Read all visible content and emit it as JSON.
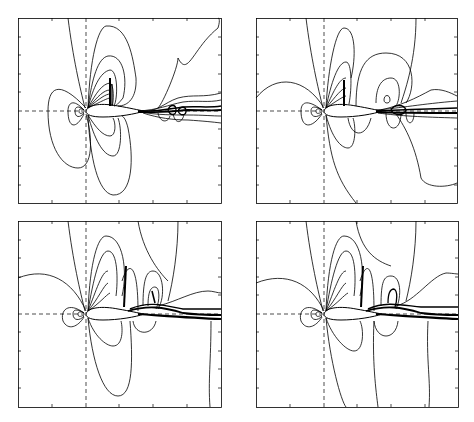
{
  "figure": {
    "layout": "2x2 grid of contour plots",
    "panels": [
      {
        "id": "top-left",
        "description": "Contour plot of flow field around airfoil with shock on upper surface and unsteady wake",
        "frame": {
          "x": 18,
          "y": 18,
          "w": 203,
          "h": 185
        }
      },
      {
        "id": "top-right",
        "description": "Contour plot of flow field around airfoil with shock and vortex in wake",
        "frame": {
          "x": 256,
          "y": 18,
          "w": 201,
          "h": 185
        }
      },
      {
        "id": "bottom-left",
        "description": "Contour plot of flow field around airfoil with two shocks on upper surface",
        "frame": {
          "x": 18,
          "y": 221,
          "w": 203,
          "h": 186
        }
      },
      {
        "id": "bottom-right",
        "description": "Contour plot of flow field around airfoil with two shocks on upper surface",
        "frame": {
          "x": 256,
          "y": 221,
          "w": 202,
          "h": 186
        }
      }
    ],
    "line_color": "#000000",
    "background": "#ffffff"
  }
}
